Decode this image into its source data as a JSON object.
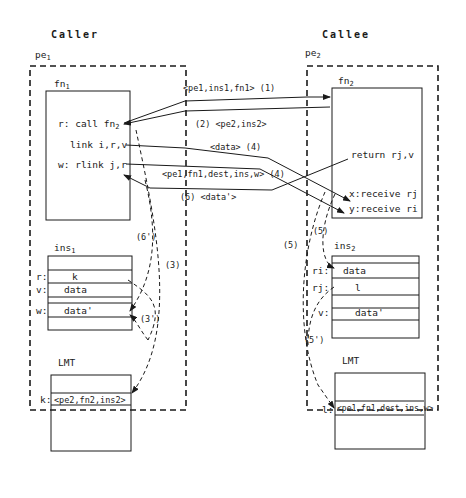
{
  "caller": {
    "title": "Caller",
    "pe_label": "pe",
    "pe_sub": "1",
    "fn_label": "fn",
    "fn_sub": "1",
    "fn_lines": [
      {
        "prefix": "r: call fn",
        "sub": "2"
      },
      {
        "prefix": "link i,r,v",
        "sub": ""
      },
      {
        "prefix": "w: rlink j,r",
        "sub": ""
      }
    ],
    "ins_label": "ins",
    "ins_sub": "1",
    "ins_rows": [
      {
        "key": "",
        "value": ""
      },
      {
        "key": "r:",
        "value": "k"
      },
      {
        "key": "v:",
        "value": "data"
      },
      {
        "key": "",
        "value": ""
      },
      {
        "key": "w:",
        "value": "data'"
      },
      {
        "key": "",
        "value": ""
      }
    ],
    "lmt_label": "LMT",
    "lmt_key": "k:",
    "lmt_entry": "<pe2,fn2,ins2>"
  },
  "callee": {
    "title": "Callee",
    "pe_label": "pe",
    "pe_sub": "2",
    "fn_label": "fn",
    "fn_sub": "2",
    "fn_lines": [
      {
        "prefix": "return rj,v"
      },
      {
        "prefix": "x:receive rj"
      },
      {
        "prefix": "y:receive ri"
      }
    ],
    "ins_label": "ins",
    "ins_sub": "2",
    "ins_rows": [
      {
        "key": "",
        "value": ""
      },
      {
        "key": "ri:",
        "value": "data"
      },
      {
        "key": "rj:",
        "value": "l"
      },
      {
        "key": "",
        "value": ""
      },
      {
        "key": "v:",
        "value": "data'"
      },
      {
        "key": "",
        "value": ""
      }
    ],
    "lmt_label": "LMT",
    "lmt_key": "l:",
    "lmt_entry": "<pe1,fn1,dest,ins,w>"
  },
  "messages": [
    {
      "id": "1",
      "label": "<pe1,ins1,fn1> (1)"
    },
    {
      "id": "2",
      "label": "(2)  <pe2,ins2>"
    },
    {
      "id": "4a",
      "label": "<data>  (4)"
    },
    {
      "id": "4b",
      "label": "<pe1,fn1,dest,ins,w> (4)"
    },
    {
      "id": "6",
      "label": "(6)  <data'>"
    }
  ],
  "local_steps": [
    {
      "id": "3",
      "label": "(3)"
    },
    {
      "id": "3p",
      "label": "(3')"
    },
    {
      "id": "6p",
      "label": "(6')"
    },
    {
      "id": "5a",
      "label": "(5)"
    },
    {
      "id": "5b",
      "label": "(5)"
    },
    {
      "id": "5p",
      "label": "(5')"
    }
  ]
}
